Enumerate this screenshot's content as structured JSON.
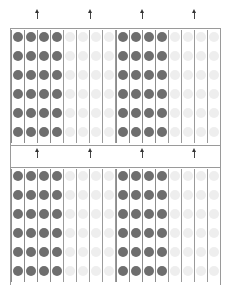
{
  "diagram": {
    "type": "dot-array",
    "colors": {
      "filled_dot": "#6e6e6e",
      "faint_dot": "#eeeeee",
      "line": "#8c8c8c",
      "arrow": "#333333",
      "background": "#ffffff"
    },
    "sections": [
      {
        "name": "top-section",
        "top": 28,
        "height": 117,
        "rows": 6,
        "arrows_x": [
          37,
          90,
          142,
          194
        ],
        "arrows_y": 12
      },
      {
        "name": "bottom-section",
        "top": 167,
        "height": 117,
        "rows": 6,
        "arrows_x": [
          37,
          90,
          142,
          194
        ],
        "arrows_y": 151
      }
    ],
    "blocks": [
      {
        "kind": "filled",
        "x": 12,
        "columns": 4
      },
      {
        "kind": "faint",
        "x": 64,
        "columns": 4
      },
      {
        "kind": "filled",
        "x": 117,
        "columns": 4
      },
      {
        "kind": "faint",
        "x": 169,
        "columns": 4
      }
    ],
    "dots_per_block": 24,
    "total_filled_dots": 96,
    "total_faint_dots": 96
  }
}
